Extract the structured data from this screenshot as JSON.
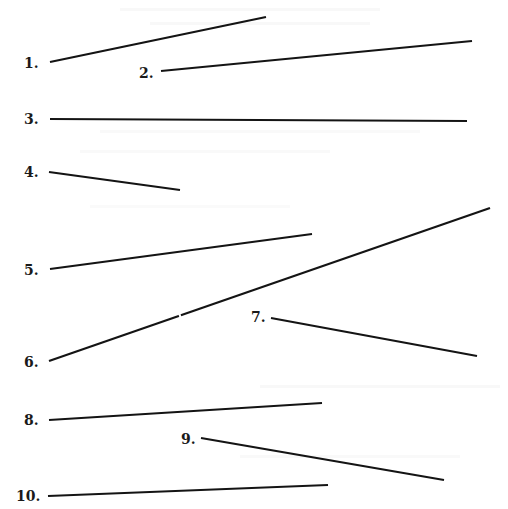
{
  "items": [
    {
      "label": "1."
    },
    {
      "label": "2."
    },
    {
      "label": "3."
    },
    {
      "label": "4."
    },
    {
      "label": "5."
    },
    {
      "label": "6."
    },
    {
      "label": "7."
    },
    {
      "label": "8."
    },
    {
      "label": "9."
    },
    {
      "label": "10."
    }
  ],
  "colors": {
    "ink": "#141414",
    "background": "#ffffff"
  }
}
